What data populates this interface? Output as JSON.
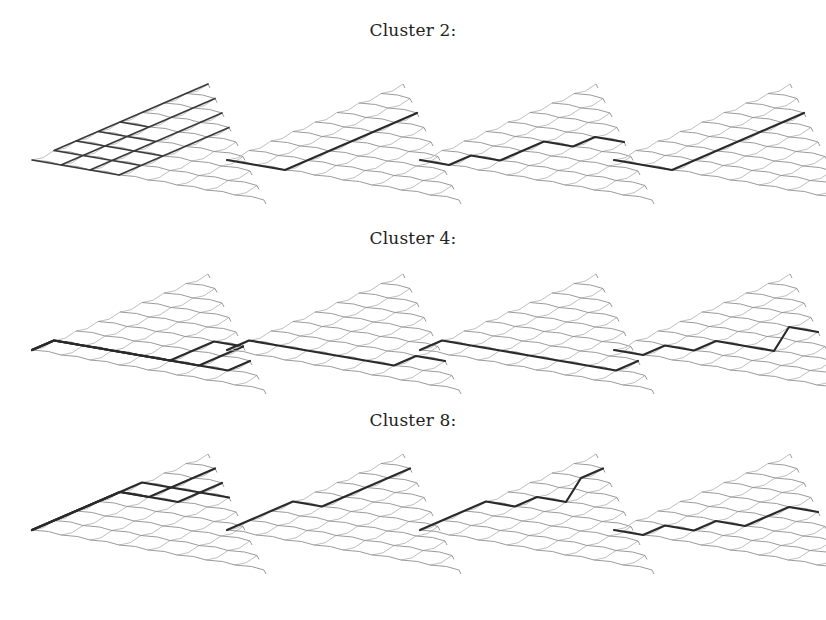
{
  "figure": {
    "rows": [
      {
        "label": "Cluster 2:",
        "label_y": 20,
        "panel_y": 75,
        "panels": [
          {
            "paths": [
              [
                0,
                0,
                0
              ],
              [
                1,
                0,
                0
              ],
              [
                2,
                0,
                0
              ],
              [
                3,
                0,
                0
              ],
              [
                4,
                0,
                0
              ],
              [
                5,
                0,
                0
              ],
              [
                6,
                0,
                0
              ],
              [
                7,
                0,
                0
              ]
            ],
            "multi": true
          },
          {
            "paths": [
              [
                0,
                1,
                2,
                2,
                2,
                2,
                2,
                2,
                2
              ]
            ]
          },
          {
            "paths": [
              [
                0,
                1,
                1,
                2,
                2,
                2,
                3,
                3,
                4
              ]
            ]
          },
          {
            "paths": [
              [
                0,
                1,
                2,
                2,
                2,
                2,
                2,
                2,
                2
              ]
            ]
          }
        ]
      },
      {
        "label": "Cluster 4:",
        "label_y": 228,
        "panel_y": 265,
        "panels": [
          {
            "paths": [
              [
                0,
                0,
                1,
                2,
                3,
                4,
                4,
                4,
                5
              ],
              [
                0,
                0,
                1,
                2,
                3,
                4,
                5,
                6,
                6
              ],
              [
                0,
                0,
                1,
                2,
                3,
                4,
                5,
                5,
                5
              ]
            ],
            "multi": true
          },
          {
            "paths": [
              [
                0,
                0,
                1,
                2,
                3,
                4,
                5,
                5,
                6
              ]
            ]
          },
          {
            "paths": [
              [
                0,
                0,
                1,
                2,
                3,
                4,
                5,
                6,
                6
              ]
            ]
          },
          {
            "paths": [
              [
                0,
                1,
                1,
                2,
                2,
                3,
                4,
                3,
                4
              ]
            ]
          }
        ]
      },
      {
        "label": "Cluster 8:",
        "label_y": 410,
        "panel_y": 445,
        "panels": [
          {
            "paths": [
              [
                0,
                0,
                0,
                0,
                0,
                0,
                1,
                1,
                1
              ],
              [
                0,
                0,
                0,
                0,
                0,
                1,
                1,
                2,
                2
              ],
              [
                0,
                0,
                0,
                0,
                0,
                1,
                2,
                2,
                3
              ]
            ],
            "multi": true
          },
          {
            "paths": [
              [
                0,
                0,
                0,
                0,
                1,
                1,
                1,
                1,
                1
              ]
            ]
          },
          {
            "paths": [
              [
                0,
                0,
                0,
                0,
                1,
                1,
                2,
                1,
                1
              ]
            ]
          },
          {
            "paths": [
              [
                0,
                1,
                1,
                2,
                2,
                3,
                3,
                3,
                4
              ]
            ]
          }
        ]
      }
    ],
    "panel_x": [
      30,
      225,
      418,
      612
    ],
    "lattice_size": 9,
    "colors": {
      "lattice": "#b8b8b8",
      "lattice_dark": "#8e8e8e",
      "path": "#2a2a2a",
      "background": "#ffffff"
    }
  }
}
